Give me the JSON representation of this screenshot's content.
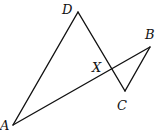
{
  "diagram": {
    "type": "geometry-figure",
    "points": {
      "D": {
        "label": "D",
        "x": 78,
        "y": 12,
        "label_x": 62,
        "label_y": 14
      },
      "B": {
        "label": "B",
        "x": 150,
        "y": 47,
        "label_x": 145,
        "label_y": 39
      },
      "C": {
        "label": "C",
        "x": 125,
        "y": 91,
        "label_x": 117,
        "label_y": 110
      },
      "A": {
        "label": "A",
        "x": 13,
        "y": 125,
        "label_x": 0,
        "label_y": 130
      },
      "X": {
        "label": "X",
        "x": 111,
        "y": 69,
        "label_x": 92,
        "label_y": 72
      }
    },
    "segments": [
      {
        "from": "D",
        "to": "A"
      },
      {
        "from": "D",
        "to": "C"
      },
      {
        "from": "C",
        "to": "B"
      },
      {
        "from": "B",
        "to": "A"
      }
    ]
  }
}
